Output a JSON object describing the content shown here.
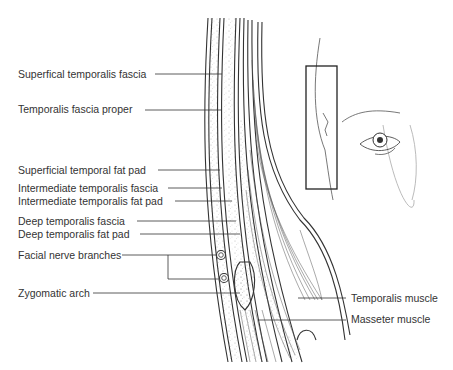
{
  "diagram": {
    "labels": [
      {
        "id": "superficial-temporalis-fascia",
        "text": "Superfical temporalis fascia",
        "x": 18,
        "y": 69
      },
      {
        "id": "temporalis-fascia-proper",
        "text": "Temporalis fascia proper",
        "x": 18,
        "y": 103
      },
      {
        "id": "superficial-temporal-fat-pad",
        "text": "Superficial temporal fat pad",
        "x": 18,
        "y": 164
      },
      {
        "id": "intermediate-temporalis-fascia",
        "text": "Intermediate temporalis fascia",
        "x": 18,
        "y": 182
      },
      {
        "id": "intermediate-temporalis-fat-pad",
        "text": "Intermediate temporalis fat pad",
        "x": 18,
        "y": 195
      },
      {
        "id": "deep-temporalis-fascia",
        "text": "Deep temporalis fascia",
        "x": 18,
        "y": 214
      },
      {
        "id": "deep-temporalis-fat-pad",
        "text": "Deep temporalis fat pad",
        "x": 18,
        "y": 228
      },
      {
        "id": "facial-nerve-branches",
        "text": "Facial nerve branches",
        "x": 18,
        "y": 250
      },
      {
        "id": "zygomatic-arch",
        "text": "Zygomatic arch",
        "x": 18,
        "y": 287
      },
      {
        "id": "temporalis-muscle",
        "text": "Temporalis muscle",
        "x": 351,
        "y": 293
      },
      {
        "id": "masseter-muscle",
        "text": "Masseter muscle",
        "x": 351,
        "y": 313
      }
    ],
    "inset": {
      "description": "Face profile with eye; rectangle marks temporal region",
      "box": {
        "x": 306,
        "y": 66,
        "w": 31,
        "h": 123
      }
    },
    "colors": {
      "line": "#333333",
      "stipple": "#999999",
      "text": "#333333"
    }
  }
}
